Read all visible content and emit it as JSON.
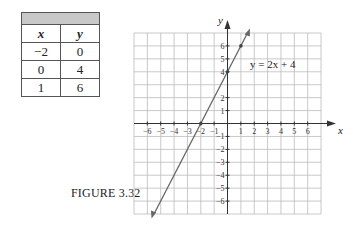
{
  "table": {
    "headers": [
      "x",
      "y"
    ],
    "rows": [
      [
        "−2",
        "0"
      ],
      [
        "0",
        "4"
      ],
      [
        "1",
        "6"
      ]
    ]
  },
  "figure_caption": "FIGURE 3.32",
  "graph": {
    "x_axis_label": "x",
    "y_axis_label": "y",
    "equation_label": "y = 2x + 4",
    "x_tick_labels": [
      "−6",
      "−5",
      "−4",
      "−3",
      "−2",
      "−1",
      "1",
      "2",
      "3",
      "4",
      "5",
      "6"
    ],
    "y_tick_labels": [
      "6",
      "5",
      "4",
      "2",
      "1",
      "−1",
      "−2",
      "−3",
      "−4",
      "−5",
      "−6"
    ]
  },
  "chart_data": {
    "type": "line",
    "title": "FIGURE 3.32",
    "xlabel": "x",
    "ylabel": "y",
    "xlim": [
      -7,
      7
    ],
    "ylim": [
      -7,
      7
    ],
    "grid": true,
    "series": [
      {
        "name": "y = 2x + 4",
        "x": [
          -5.5,
          -2,
          0,
          1,
          1.5
        ],
        "y": [
          -7,
          0,
          4,
          6,
          7
        ]
      }
    ],
    "points": [
      {
        "x": -2,
        "y": 0
      },
      {
        "x": 0,
        "y": 4
      },
      {
        "x": 1,
        "y": 6
      }
    ],
    "annotations": [
      "y = 2x + 4"
    ]
  }
}
